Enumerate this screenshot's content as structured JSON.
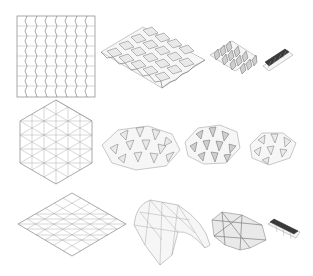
{
  "figure": {
    "rows": [
      {
        "pattern": "miura-ori",
        "panels": [
          "crease-pattern-square",
          "partially-folded",
          "mostly-folded",
          "fully-folded"
        ]
      },
      {
        "pattern": "triangular-hexagon",
        "panels": [
          "crease-pattern-hexagon",
          "partially-folded",
          "mostly-folded",
          "fully-folded"
        ]
      },
      {
        "pattern": "triangulated-square-curved",
        "panels": [
          "crease-pattern-diamond",
          "curved-shell",
          "crumpled",
          "fully-folded"
        ]
      }
    ],
    "caption": ""
  }
}
